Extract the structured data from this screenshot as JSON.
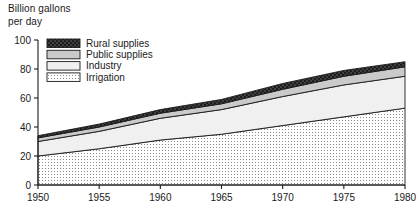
{
  "chart_data": {
    "type": "area",
    "title": "",
    "ylabel": "Billion gallons\nper day",
    "xlabel": "",
    "ylim": [
      0,
      100
    ],
    "xlim": [
      1950,
      1980
    ],
    "grid": false,
    "stacked": true,
    "legend_position": "top-left-inside",
    "x": [
      1950,
      1955,
      1960,
      1965,
      1970,
      1975,
      1980
    ],
    "xticks": [
      "1950",
      "1955",
      "1960",
      "1965",
      "1970",
      "1975",
      "1980"
    ],
    "yticks": [
      "0",
      "20",
      "40",
      "60",
      "80",
      "100"
    ],
    "series": [
      {
        "name": "Irrigation",
        "swatch": "fine-dots",
        "values": [
          20,
          25,
          31,
          35,
          41,
          47,
          53
        ]
      },
      {
        "name": "Industry",
        "swatch": "very-light",
        "values": [
          10,
          12,
          15,
          17,
          20,
          22,
          22
        ]
      },
      {
        "name": "Public supplies",
        "swatch": "light-gray",
        "values": [
          2.5,
          3,
          3.5,
          4,
          5,
          6,
          6.5
        ]
      },
      {
        "name": "Rural supplies",
        "swatch": "dark-check",
        "values": [
          1.5,
          2,
          2.5,
          3,
          4,
          4,
          3.5
        ]
      }
    ],
    "cumulative_totals": [
      34,
      42,
      52,
      59,
      70,
      79,
      85
    ],
    "legend_order": [
      "Rural supplies",
      "Public supplies",
      "Industry",
      "Irrigation"
    ]
  },
  "colors": {
    "axis": "#1a1a1a",
    "rural": "#4a4a4a",
    "public": "#c9c9c9",
    "industry": "#efefef",
    "irrigation": "#ffffff",
    "irrigation_dot": "#8a8a8a"
  }
}
